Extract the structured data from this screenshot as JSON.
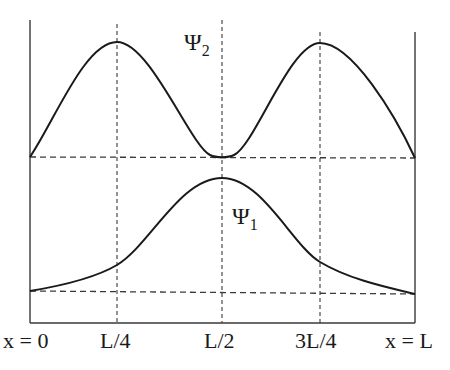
{
  "figure": {
    "type": "wavefunction-diagram"
  },
  "labels": {
    "psi2": {
      "symbol": "Ψ",
      "subscript": "2"
    },
    "psi1": {
      "symbol": "Ψ",
      "subscript": "1"
    }
  },
  "x_axis": {
    "ticks": [
      "x = 0",
      "L/4",
      "L/2",
      "3L/4",
      "x = L"
    ]
  },
  "colors": {
    "line": "#1a1a1a",
    "dash": "#3a3a3a",
    "background": "#ffffff"
  }
}
